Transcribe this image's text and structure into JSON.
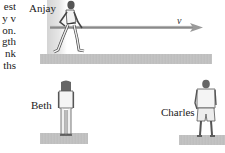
{
  "figure": {
    "type": "physics-illustration",
    "clipped_problem_text": [
      "est",
      "y v",
      "on.",
      "gth",
      "nk",
      "ths"
    ],
    "people": [
      {
        "name": "Anjay",
        "pose": "running carrying pole"
      },
      {
        "name": "Beth",
        "pose": "standing, facing away"
      },
      {
        "name": "Charles",
        "pose": "standing, facing away"
      }
    ],
    "labels": {
      "anjay": "Anjay",
      "beth": "Beth",
      "charles": "Charles",
      "velocity": "v"
    },
    "colors": {
      "ground": "#c0c0c0",
      "pole": "#8a8a8a",
      "figure_outline": "#444444",
      "text": "#222222"
    }
  }
}
